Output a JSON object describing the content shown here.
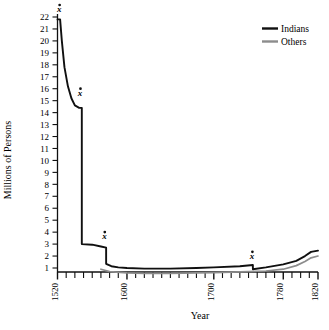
{
  "chart_data": {
    "type": "line",
    "title": "",
    "xlabel": "Year",
    "ylabel": "Millions of Persons",
    "xlim": [
      1520,
      1820
    ],
    "ylim": [
      0,
      22.6
    ],
    "grid": false,
    "legend_position": "top-right",
    "y_ticks": [
      1,
      2,
      3,
      4,
      5,
      6,
      7,
      8,
      9,
      10,
      11,
      12,
      13,
      14,
      15,
      16,
      17,
      18,
      19,
      20,
      21,
      22
    ],
    "x_ticks_labeled": [
      1520,
      1600,
      1700,
      1780,
      1820
    ],
    "x_minor_tick_interval": 10,
    "series": [
      {
        "name": "Indians",
        "color": "#101010",
        "points": [
          [
            1520,
            21.8
          ],
          [
            1523,
            21.8
          ],
          [
            1525,
            20.0
          ],
          [
            1528,
            17.8
          ],
          [
            1532,
            16.2
          ],
          [
            1536,
            15.2
          ],
          [
            1540,
            14.6
          ],
          [
            1545,
            14.4
          ],
          [
            1548,
            14.4
          ],
          [
            1548,
            3.0
          ],
          [
            1560,
            2.95
          ],
          [
            1570,
            2.8
          ],
          [
            1576,
            2.7
          ],
          [
            1576,
            1.35
          ],
          [
            1582,
            1.15
          ],
          [
            1590,
            1.05
          ],
          [
            1600,
            1.0
          ],
          [
            1620,
            0.95
          ],
          [
            1650,
            0.95
          ],
          [
            1680,
            1.0
          ],
          [
            1700,
            1.05
          ],
          [
            1730,
            1.15
          ],
          [
            1745,
            1.25
          ],
          [
            1745,
            0.9
          ],
          [
            1760,
            1.05
          ],
          [
            1780,
            1.3
          ],
          [
            1795,
            1.6
          ],
          [
            1805,
            2.0
          ],
          [
            1812,
            2.35
          ],
          [
            1820,
            2.45
          ]
        ]
      },
      {
        "name": "Others",
        "color": "#8c8c8c",
        "points": [
          [
            1570,
            0.9
          ],
          [
            1580,
            0.7
          ],
          [
            1600,
            0.6
          ],
          [
            1620,
            0.55
          ],
          [
            1650,
            0.55
          ],
          [
            1680,
            0.6
          ],
          [
            1700,
            0.62
          ],
          [
            1730,
            0.68
          ],
          [
            1760,
            0.75
          ],
          [
            1780,
            0.9
          ],
          [
            1795,
            1.2
          ],
          [
            1805,
            1.55
          ],
          [
            1812,
            1.85
          ],
          [
            1820,
            2.0
          ]
        ]
      }
    ],
    "annotations": [
      {
        "label": "x",
        "x": 1522,
        "y": 22.4,
        "note": "marker at 1520 peak"
      },
      {
        "label": "x",
        "x": 1546,
        "y": 15.4,
        "note": "marker at first drop"
      },
      {
        "label": "x",
        "x": 1574,
        "y": 3.4,
        "note": "marker at second drop"
      },
      {
        "label": "x",
        "x": 1744,
        "y": 1.75,
        "note": "marker at third drop"
      }
    ]
  },
  "axes": {
    "y_title": "Millions of Persons",
    "x_title": "Year",
    "y_tick_labels": [
      "22",
      "21",
      "20",
      "19",
      "18",
      "17",
      "16",
      "15",
      "14",
      "13",
      "12",
      "11",
      "10",
      "9",
      "8",
      "7",
      "6",
      "5",
      "4",
      "3",
      "2",
      "1"
    ],
    "x_tick_labels": [
      "1520",
      "1600",
      "1700",
      "1780",
      "1820"
    ]
  },
  "legend": {
    "entries": [
      {
        "label": "Indians",
        "color": "#101010"
      },
      {
        "label": "Others",
        "color": "#8c8c8c"
      }
    ]
  }
}
